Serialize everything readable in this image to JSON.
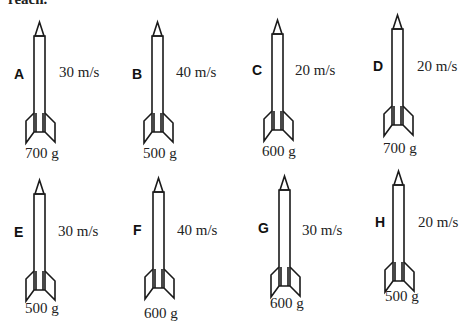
{
  "header": {
    "cutoff_text": "reach."
  },
  "rockets": [
    {
      "label": "A",
      "speed": "30 m/s",
      "mass": "700 g",
      "x": 34,
      "tip": 22,
      "letter": [
        14,
        66
      ],
      "speed_pos": [
        59,
        64
      ],
      "mass_pos": [
        25,
        145
      ]
    },
    {
      "label": "B",
      "speed": "40 m/s",
      "mass": "500 g",
      "x": 152,
      "tip": 22,
      "letter": [
        132,
        66
      ],
      "speed_pos": [
        176,
        64
      ],
      "mass_pos": [
        143,
        145
      ]
    },
    {
      "label": "C",
      "speed": "20 m/s",
      "mass": "600 g",
      "x": 272,
      "tip": 20,
      "letter": [
        252,
        62
      ],
      "speed_pos": [
        295,
        62
      ],
      "mass_pos": [
        262,
        143
      ]
    },
    {
      "label": "D",
      "speed": "20 m/s",
      "mass": "700 g",
      "x": 392,
      "tip": 15,
      "letter": [
        373,
        58
      ],
      "speed_pos": [
        417,
        58
      ],
      "mass_pos": [
        383,
        140
      ]
    },
    {
      "label": "E",
      "speed": "30 m/s",
      "mass": "500 g",
      "x": 34,
      "tip": 180,
      "letter": [
        14,
        224
      ],
      "speed_pos": [
        58,
        223
      ],
      "mass_pos": [
        25,
        300
      ]
    },
    {
      "label": "F",
      "speed": "40 m/s",
      "mass": "600 g",
      "x": 153,
      "tip": 178,
      "letter": [
        133,
        222
      ],
      "speed_pos": [
        177,
        222
      ],
      "mass_pos": [
        144,
        305
      ]
    },
    {
      "label": "G",
      "speed": "30 m/s",
      "mass": "600 g",
      "x": 279,
      "tip": 176,
      "letter": [
        258,
        220
      ],
      "speed_pos": [
        302,
        222
      ],
      "mass_pos": [
        270,
        295
      ]
    },
    {
      "label": "H",
      "speed": "20 m/s",
      "mass": "500 g",
      "x": 393,
      "tip": 171,
      "letter": [
        375,
        214
      ],
      "speed_pos": [
        418,
        214
      ],
      "mass_pos": [
        385,
        288
      ]
    }
  ]
}
